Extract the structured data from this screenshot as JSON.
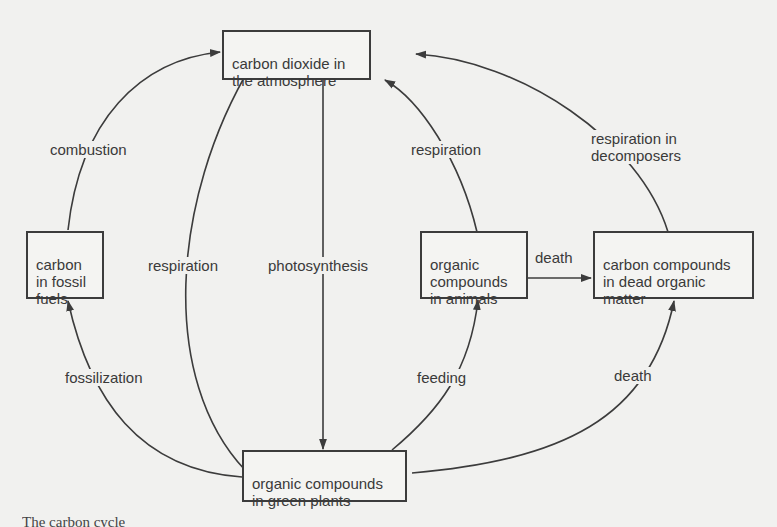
{
  "diagram": {
    "title": "Carbon cycle",
    "nodes": {
      "atmosphere": "carbon dioxide in\nthe atmosphere",
      "fossil_fuels": "carbon\nin fossil\nfuels",
      "green_plants": "organic compounds\nin green plants",
      "animals": "organic\ncompounds\nin animals",
      "dead_matter": "carbon compounds\nin dead organic\nmatter"
    },
    "edges": {
      "combustion": "combustion",
      "respiration_plants": "respiration",
      "photosynthesis": "photosynthesis",
      "respiration_animals": "respiration",
      "respiration_decomposers": "respiration in\ndecomposers",
      "death_animals": "death",
      "fossilization": "fossilization",
      "feeding": "feeding",
      "death_plants": "death"
    },
    "edge_list": [
      {
        "from": "fossil_fuels",
        "to": "atmosphere",
        "label": "combustion"
      },
      {
        "from": "green_plants",
        "to": "atmosphere",
        "label": "respiration"
      },
      {
        "from": "atmosphere",
        "to": "green_plants",
        "label": "photosynthesis"
      },
      {
        "from": "animals",
        "to": "atmosphere",
        "label": "respiration"
      },
      {
        "from": "dead_matter",
        "to": "atmosphere",
        "label": "respiration in decomposers"
      },
      {
        "from": "animals",
        "to": "dead_matter",
        "label": "death"
      },
      {
        "from": "green_plants",
        "to": "fossil_fuels",
        "label": "fossilization"
      },
      {
        "from": "green_plants",
        "to": "animals",
        "label": "feeding"
      },
      {
        "from": "green_plants",
        "to": "dead_matter",
        "label": "death"
      }
    ]
  },
  "caption": {
    "text": "The carbon cycle"
  },
  "colors": {
    "background": "#f1f1ef",
    "line": "#3c3c3c",
    "text": "#3a3a3a"
  }
}
